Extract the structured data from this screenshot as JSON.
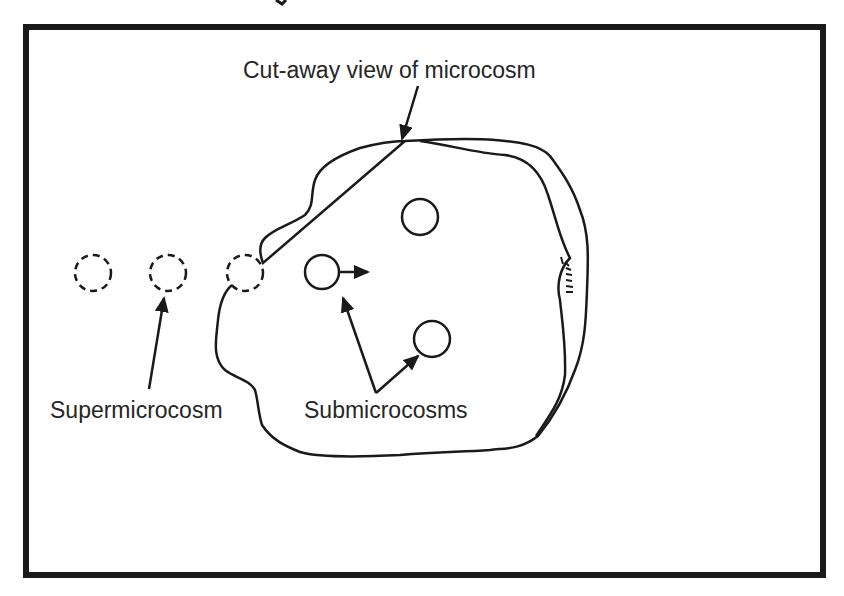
{
  "diagram": {
    "type": "conceptual illustration",
    "frame_color": "#1a1a1a",
    "line_color": "#1a1a1a",
    "labels": {
      "top": "Cut-away view of microcosm",
      "left": "Supermicrocosm",
      "center": "Submicrocosms"
    },
    "elements": {
      "microcosm": "Irregular closed boundary with cut-away flap on the right side",
      "supermicrocosms": [
        "dashed circle 1",
        "dashed circle 2",
        "dashed circle 3 (at boundary)"
      ],
      "submicrocosms": [
        "solid circle with outward arrow",
        "solid circle (upper)",
        "solid circle (lower right)"
      ]
    }
  }
}
